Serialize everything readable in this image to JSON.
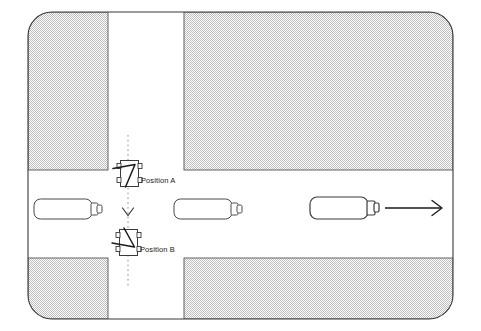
{
  "diagram": {
    "labels": {
      "position_a": "Position A",
      "position_b": "Position B"
    },
    "colors": {
      "stroke": "#3a3a3a",
      "hatch_light": "#ffffff",
      "hatch_dark": "#b8b8b8",
      "background": "#ffffff",
      "marker_stroke": "#1a1a1a"
    },
    "frame": {
      "x": 28,
      "y": 12,
      "width": 425,
      "height": 307,
      "corner_radius": 24
    },
    "road": {
      "horizontal": {
        "top": 170,
        "bottom": 258
      },
      "vertical": {
        "left": 108,
        "right": 184
      }
    },
    "blocks": [
      {
        "name": "block-top-left",
        "x": 28,
        "y": 12,
        "width": 80,
        "height": 158
      },
      {
        "name": "block-top-right",
        "x": 184,
        "y": 12,
        "width": 269,
        "height": 158
      },
      {
        "name": "block-bottom-left",
        "x": 28,
        "y": 258,
        "width": 80,
        "height": 61
      },
      {
        "name": "block-bottom-right",
        "x": 184,
        "y": 258,
        "width": 269,
        "height": 61
      }
    ],
    "path_line": {
      "name": "dotted-trajectory",
      "x": 128,
      "y_start": 135,
      "y_end": 288,
      "style": "dotted",
      "chevron_y": 213,
      "chevron_direction": "down"
    },
    "vehicles": [
      {
        "name": "vehicle-left",
        "x": 34,
        "y": 199,
        "length": 64,
        "width": 20,
        "heading": "east"
      },
      {
        "name": "vehicle-middle",
        "x": 174,
        "y": 199,
        "length": 64,
        "width": 20,
        "heading": "east"
      },
      {
        "name": "vehicle-right",
        "x": 310,
        "y": 197,
        "length": 64,
        "width": 22,
        "heading": "east"
      }
    ],
    "direction_arrow": {
      "name": "direction-arrow-east",
      "x1": 385,
      "x2": 443,
      "y": 208,
      "direction": "east"
    },
    "markers": [
      {
        "name": "marker-position-a",
        "x": 120,
        "y": 160,
        "width": 19,
        "height": 27,
        "rotation": 0
      },
      {
        "name": "marker-position-b",
        "x": 119,
        "y": 229,
        "width": 19,
        "height": 27,
        "rotation": 0
      }
    ]
  }
}
